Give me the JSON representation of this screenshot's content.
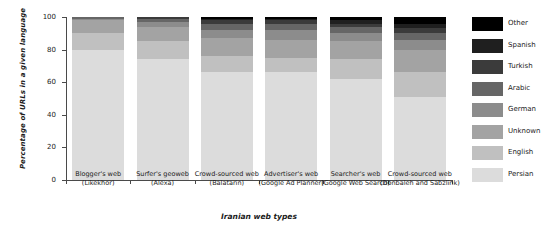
{
  "chart_data": {
    "type": "bar",
    "stacked": true,
    "title": "",
    "xlabel": "Iranian web types",
    "ylabel": "Percentage of URLs in a given language",
    "ylim": [
      0,
      100
    ],
    "yticks": [
      0,
      20,
      40,
      60,
      80,
      100
    ],
    "grid": false,
    "legend_position": "right",
    "categories": [
      "Blogger's web (Likekhor)",
      "Surfer's geoweb (Alexa)",
      "Crowd-sourced web (Balatarin)",
      "Advertiser's web (Google Ad Planner)",
      "Searcher's web (Google Web Search)",
      "Crowd-sourced web (Donbaleh and Sabzlink)"
    ],
    "categories_lines": [
      [
        "Blogger's web",
        "(Likekhor)"
      ],
      [
        "Surfer's geoweb",
        "(Alexa)"
      ],
      [
        "Crowd-sourced web",
        "(Balatarin)"
      ],
      [
        "Advertiser's web",
        "(Google Ad Planner)"
      ],
      [
        "Searcher's web",
        "(Google Web Search)"
      ],
      [
        "Crowd-sourced web",
        "(Donbaleh and Sabzlink)"
      ]
    ],
    "series": [
      {
        "name": "Persian",
        "color": "#dcdcdc",
        "values": [
          80,
          74,
          66,
          66,
          62,
          51
        ]
      },
      {
        "name": "English",
        "color": "#c0c0c0",
        "values": [
          10,
          11,
          10,
          9,
          12,
          15
        ]
      },
      {
        "name": "Unknown",
        "color": "#a3a3a3",
        "values": [
          8,
          9,
          11,
          11,
          11,
          14
        ]
      },
      {
        "name": "German",
        "color": "#8c8c8c",
        "values": [
          1,
          3,
          5,
          6,
          5,
          6
        ]
      },
      {
        "name": "Arabic",
        "color": "#666666",
        "values": [
          1,
          2,
          4,
          4,
          4,
          4
        ]
      },
      {
        "name": "Turkish",
        "color": "#3b3b3b",
        "values": [
          0,
          1,
          2,
          2,
          2,
          3
        ]
      },
      {
        "name": "Spanish",
        "color": "#1f1f1f",
        "values": [
          0,
          0,
          1,
          1,
          2,
          3
        ]
      },
      {
        "name": "Other",
        "color": "#000000",
        "values": [
          0,
          0,
          1,
          1,
          2,
          4
        ]
      }
    ]
  },
  "legend": {
    "entries": [
      {
        "label": "Other",
        "color": "#000000"
      },
      {
        "label": "Spanish",
        "color": "#1f1f1f"
      },
      {
        "label": "Turkish",
        "color": "#3b3b3b"
      },
      {
        "label": "Arabic",
        "color": "#666666"
      },
      {
        "label": "German",
        "color": "#8c8c8c"
      },
      {
        "label": "Unknown",
        "color": "#a3a3a3"
      },
      {
        "label": "English",
        "color": "#c0c0c0"
      },
      {
        "label": "Persian",
        "color": "#dcdcdc"
      }
    ]
  },
  "axis": {
    "y_title": "Percentage of URLs in a given language",
    "x_title": "Iranian web types",
    "y_tick_labels": [
      "0",
      "20",
      "40",
      "60",
      "80",
      "100"
    ]
  }
}
